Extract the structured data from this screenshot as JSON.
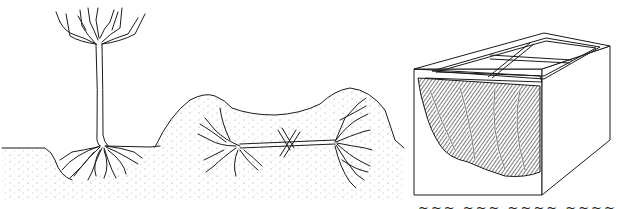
{
  "illustration": {
    "panels": [
      {
        "id": "standard-tree",
        "subject": "standard (tree-form) plant with exposed root ball in soil"
      },
      {
        "id": "buried-plant",
        "subject": "plant laid horizontally and buried under a mound of soil, pegged down with crossed stakes"
      },
      {
        "id": "cold-frame",
        "subject": "cutaway cold frame with glass lights containing stored plants"
      }
    ],
    "ink_color": "#1a1a1a",
    "background_color": "#ffffff",
    "stipple_color": "#6a6a6a"
  },
  "caption": {
    "fragment": "~~~  ~~~  ~~~~  ~~~~"
  }
}
